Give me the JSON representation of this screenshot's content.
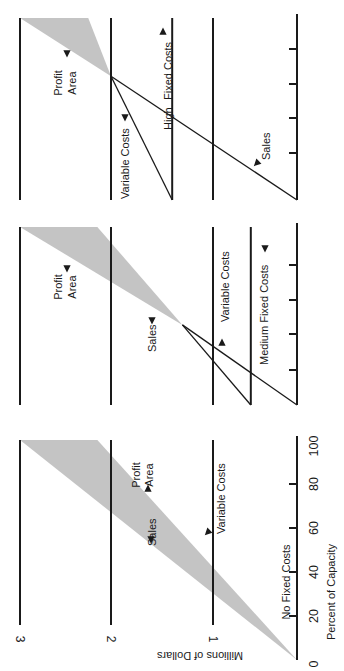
{
  "chart_data": {
    "type": "line",
    "title": "",
    "orientation": "rotated 90° counter-clockwise",
    "xlabel": "Percent of Capacity",
    "ylabel": "Millions of Dollars",
    "xlim": [
      0,
      100
    ],
    "ylim": [
      0,
      3
    ],
    "x_ticks": [
      0,
      20,
      40,
      60,
      80,
      100
    ],
    "x_tick_labels": [
      "0",
      "20",
      "40",
      "60",
      "80",
      "100"
    ],
    "y_ticks": [
      1,
      2,
      3
    ],
    "y_tick_labels": [
      "1",
      "2",
      "3"
    ],
    "grid": true,
    "panels": [
      {
        "name": "No Fixed Costs",
        "fixed_costs": 0,
        "series": [
          {
            "name": "Sales",
            "x": [
              0,
              100
            ],
            "y": [
              0,
              3.0
            ]
          },
          {
            "name": "Variable Costs",
            "x": [
              0,
              100
            ],
            "y": [
              0,
              2.15
            ]
          }
        ],
        "break_even": {
          "x": 0,
          "y": 0
        },
        "annotations": [
          "Sales",
          "Variable Costs",
          "Profit Area",
          "No Fixed Costs"
        ]
      },
      {
        "name": "Medium Fixed Costs",
        "fixed_costs": 0.55,
        "series": [
          {
            "name": "Sales",
            "x": [
              0,
              100
            ],
            "y": [
              0,
              3.0
            ]
          },
          {
            "name": "Variable Costs",
            "x": [
              0,
              100
            ],
            "y": [
              0.55,
              2.15
            ]
          },
          {
            "name": "Medium Fixed Costs",
            "x": [
              0,
              100
            ],
            "y": [
              0.55,
              0.55
            ]
          }
        ],
        "break_even": {
          "x": 45,
          "y": 1.3
        },
        "annotations": [
          "Sales",
          "Variable Costs",
          "Profit Area",
          "Medium Fixed Costs"
        ]
      },
      {
        "name": "High Fixed Costs",
        "fixed_costs": 1.4,
        "series": [
          {
            "name": "Sales",
            "x": [
              0,
              100
            ],
            "y": [
              0,
              3.0
            ]
          },
          {
            "name": "Variable Costs",
            "x": [
              0,
              100
            ],
            "y": [
              1.4,
              2.25
            ]
          },
          {
            "name": "High Fixed Costs",
            "x": [
              0,
              100
            ],
            "y": [
              1.4,
              1.4
            ]
          }
        ],
        "break_even": {
          "x": 68,
          "y": 2.0
        },
        "annotations": [
          "Sales",
          "Variable Costs",
          "Profit Area",
          "High Fixed Costs"
        ]
      }
    ]
  },
  "labels": {
    "sales": "Sales",
    "variable_costs": "Variable Costs",
    "profit": "Profit",
    "area": "Area",
    "no_fixed": "No Fixed Costs",
    "medium_fixed": "Medium Fixed Costs",
    "high": "High",
    "fixed_costs": "Fixed Costs",
    "x_axis": "Percent of Capacity",
    "y_axis": "Millions of Dollars"
  }
}
